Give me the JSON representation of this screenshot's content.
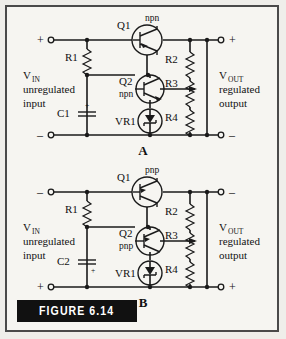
{
  "figure": {
    "caption": "FIGURE 6.14",
    "background_color": "#f6f5f1",
    "line_color": "#1a1a1a",
    "caption_bar_color": "#111111"
  },
  "circuits": [
    {
      "id": "A",
      "panel_label": "A",
      "transistor_type": "npn",
      "input_terminal_top_sign": "+",
      "input_terminal_bottom_sign": "–",
      "output_terminal_top_sign": "+",
      "output_terminal_bottom_sign": "–",
      "input_label": {
        "v": "V",
        "sub": "IN",
        "line2": "unregulated",
        "line3": "input"
      },
      "output_label": {
        "v": "V",
        "sub": "OUT",
        "line2": "regulated",
        "line3": "output"
      },
      "components": [
        {
          "ref": "Q1",
          "type": "transistor",
          "note": "npn"
        },
        {
          "ref": "Q2",
          "type": "transistor",
          "note": "npn"
        },
        {
          "ref": "R1",
          "type": "resistor"
        },
        {
          "ref": "R2",
          "type": "resistor"
        },
        {
          "ref": "R3",
          "type": "potentiometer"
        },
        {
          "ref": "R4",
          "type": "resistor"
        },
        {
          "ref": "C1",
          "type": "capacitor",
          "polarity": "+"
        },
        {
          "ref": "VR1",
          "type": "zener-diode"
        }
      ]
    },
    {
      "id": "B",
      "panel_label": "B",
      "transistor_type": "pnp",
      "input_terminal_top_sign": "–",
      "input_terminal_bottom_sign": "+",
      "output_terminal_top_sign": "–",
      "output_terminal_bottom_sign": "+",
      "input_label": {
        "v": "V",
        "sub": "IN",
        "line2": "unregulated",
        "line3": "input"
      },
      "output_label": {
        "v": "V",
        "sub": "OUT",
        "line2": "regulated",
        "line3": "output"
      },
      "components": [
        {
          "ref": "Q1",
          "type": "transistor",
          "note": "pnp"
        },
        {
          "ref": "Q2",
          "type": "transistor",
          "note": "pnp"
        },
        {
          "ref": "R1",
          "type": "resistor"
        },
        {
          "ref": "R2",
          "type": "resistor"
        },
        {
          "ref": "R3",
          "type": "potentiometer"
        },
        {
          "ref": "R4",
          "type": "resistor"
        },
        {
          "ref": "C2",
          "type": "capacitor",
          "polarity": "+"
        },
        {
          "ref": "VR1",
          "type": "zener-diode"
        }
      ]
    }
  ]
}
